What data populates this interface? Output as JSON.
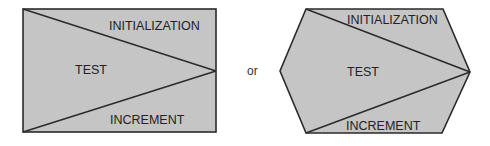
{
  "colors": {
    "fill": "#c5c5c5",
    "stroke": "#2a2a2a",
    "text": "#222222",
    "background": "#ffffff"
  },
  "diagram": {
    "rectangle_symbol": {
      "shape": "rectangle",
      "regions": {
        "top": "INITIALIZATION",
        "middle": "TEST",
        "bottom": "INCREMENT"
      }
    },
    "connector": "or",
    "hexagon_symbol": {
      "shape": "hexagon",
      "regions": {
        "top": "INITIALIZATION",
        "middle": "TEST",
        "bottom": "INCREMENT"
      }
    }
  }
}
